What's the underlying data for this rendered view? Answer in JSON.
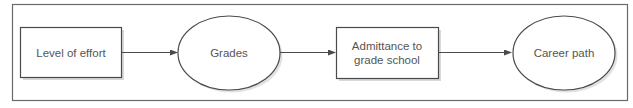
{
  "diagram": {
    "type": "flowchart",
    "direction": "left-to-right",
    "colors": {
      "stroke": "#4a4a4a",
      "frame": "#6a6a6a",
      "shadow": "#d9d9d9",
      "text": "#555555",
      "fill": "#ffffff"
    },
    "nodes": [
      {
        "id": "effort",
        "shape": "rectangle",
        "lines": [
          "Level of effort"
        ]
      },
      {
        "id": "grades",
        "shape": "ellipse",
        "lines": [
          "Grades"
        ]
      },
      {
        "id": "admittance",
        "shape": "rectangle",
        "lines": [
          "Admittance to",
          "grade school"
        ]
      },
      {
        "id": "career",
        "shape": "ellipse",
        "lines": [
          "Career path"
        ]
      }
    ],
    "edges": [
      {
        "from": "effort",
        "to": "grades"
      },
      {
        "from": "grades",
        "to": "admittance"
      },
      {
        "from": "admittance",
        "to": "career"
      }
    ]
  }
}
